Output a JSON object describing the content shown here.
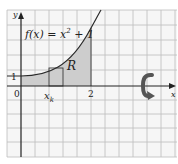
{
  "figure": {
    "function_label": "f(x) = x² + 1",
    "function_label_parts": {
      "lhs": "f(x)",
      "eq": " = x",
      "exp": "2",
      "rest": " + 1"
    },
    "region_label": "R",
    "axis_x_label": "x",
    "axis_y_label": "y",
    "origin_label": "0",
    "tick_y_1": "1",
    "tick_x_2": "2",
    "xk_label": "x",
    "xk_subscript": "k",
    "rotation_icon": "rotate-arrow-icon"
  },
  "colors": {
    "grid": "#b8b8b8",
    "axis": "#222222",
    "curve": "#2a2a2a",
    "region_fill": "#cfcfcf",
    "rotation_icon": "#555555",
    "background": "#f5f5f5"
  }
}
